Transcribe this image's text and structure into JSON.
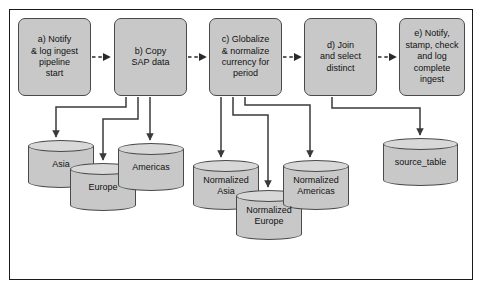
{
  "diagram": {
    "frame": {
      "border_color": "#1a1a1a",
      "background": "#ffffff"
    },
    "style": {
      "box_fill": "#c8c8c8",
      "box_stroke": "#4a4a4a",
      "cylinder_fill": "#c8c8c8",
      "cylinder_top_fill": "#d8d8d8",
      "connector_color": "#3a3a3a",
      "text_color": "#111111"
    },
    "process_steps": [
      {
        "id": "a",
        "label": "a) Notify\n& log ingest\npipeline\nstart"
      },
      {
        "id": "b",
        "label": "b) Copy\nSAP data"
      },
      {
        "id": "c",
        "label": "c) Globalize\n& normalize\ncurrency for\nperiod"
      },
      {
        "id": "d",
        "label": "d) Join\nand select\ndistinct"
      },
      {
        "id": "e",
        "label": "e) Notify,\nstamp, check\nand log\ncomplete\ningest"
      }
    ],
    "datastores": [
      {
        "id": "asia",
        "label": "Asia"
      },
      {
        "id": "europe",
        "label": "Europe"
      },
      {
        "id": "americas",
        "label": "Americas"
      },
      {
        "id": "normalized_asia",
        "label": "Normalized\nAsia"
      },
      {
        "id": "normalized_europe",
        "label": "Normalized\nEurope"
      },
      {
        "id": "normalized_americas",
        "label": "Normalized\nAmericas"
      },
      {
        "id": "source_table",
        "label": "source_table"
      }
    ],
    "flow_connections": [
      {
        "from": "a",
        "to": "b",
        "style": "dashed"
      },
      {
        "from": "b",
        "to": "c",
        "style": "dashed"
      },
      {
        "from": "c",
        "to": "d",
        "style": "dashed"
      },
      {
        "from": "d",
        "to": "e",
        "style": "dashed"
      },
      {
        "from": "b",
        "to": "asia",
        "style": "solid"
      },
      {
        "from": "b",
        "to": "europe",
        "style": "solid"
      },
      {
        "from": "b",
        "to": "americas",
        "style": "solid"
      },
      {
        "from": "c",
        "to": "normalized_asia",
        "style": "solid"
      },
      {
        "from": "c",
        "to": "normalized_europe",
        "style": "solid"
      },
      {
        "from": "c",
        "to": "normalized_americas",
        "style": "solid"
      },
      {
        "from": "d",
        "to": "source_table",
        "style": "solid"
      }
    ]
  }
}
